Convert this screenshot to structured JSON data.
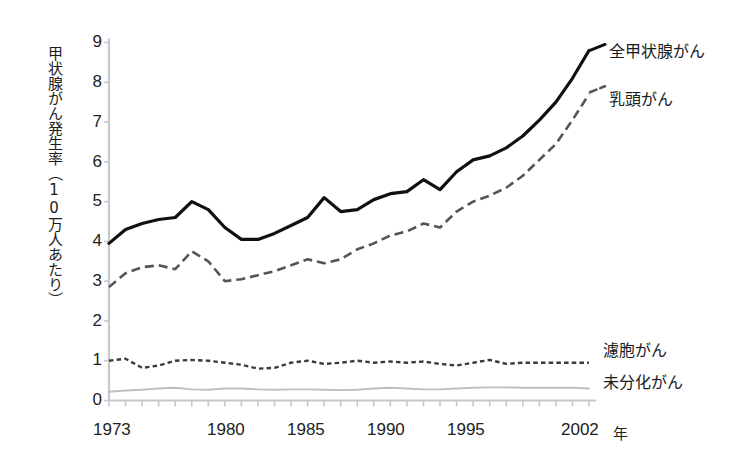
{
  "chart_data": {
    "type": "line",
    "title": "",
    "subtitle": "",
    "xlabel": "年",
    "ylabel": "甲状腺がん発生率（10万人あたり）",
    "xlim": [
      1973,
      2002
    ],
    "ylim": [
      0,
      9
    ],
    "grid": false,
    "legend_position": "right-inline-labels",
    "x": [
      1973,
      1974,
      1975,
      1976,
      1977,
      1978,
      1979,
      1980,
      1981,
      1982,
      1983,
      1984,
      1985,
      1986,
      1987,
      1988,
      1989,
      1990,
      1991,
      1992,
      1993,
      1994,
      1995,
      1996,
      1997,
      1998,
      1999,
      2000,
      2001,
      2002
    ],
    "y_ticks": [
      0,
      1,
      2,
      3,
      4,
      5,
      6,
      7,
      8,
      9
    ],
    "x_ticks_labeled": [
      1973,
      1980,
      1985,
      1990,
      1995,
      2002
    ],
    "series": [
      {
        "name": "全甲状腺がん",
        "style": "solid-black",
        "color": "#101010",
        "label_x": 2002,
        "label_y": 8.8,
        "values": [
          3.95,
          4.3,
          4.45,
          4.55,
          4.6,
          5.0,
          4.8,
          4.35,
          4.05,
          4.05,
          4.2,
          4.4,
          4.6,
          5.1,
          4.75,
          4.8,
          5.05,
          5.2,
          5.25,
          5.55,
          5.3,
          5.75,
          6.05,
          6.15,
          6.35,
          6.65,
          7.05,
          7.5,
          8.1,
          8.8
        ]
      },
      {
        "name": "乳頭がん",
        "style": "dashed-gray",
        "color": "#555555",
        "label_x": 2002,
        "label_y": 7.75,
        "values": [
          2.85,
          3.2,
          3.35,
          3.4,
          3.3,
          3.75,
          3.5,
          3.0,
          3.05,
          3.15,
          3.25,
          3.4,
          3.55,
          3.45,
          3.55,
          3.8,
          3.95,
          4.15,
          4.25,
          4.45,
          4.35,
          4.75,
          5.0,
          5.15,
          5.35,
          5.65,
          6.05,
          6.45,
          7.05,
          7.7
        ]
      },
      {
        "name": "濾胞がん",
        "style": "dotted-dark",
        "color": "#3a3a3a",
        "label_x": 2002,
        "label_y": 1.05,
        "values": [
          1.0,
          1.05,
          0.82,
          0.88,
          1.0,
          1.02,
          1.0,
          0.95,
          0.9,
          0.8,
          0.82,
          0.95,
          1.0,
          0.92,
          0.95,
          1.0,
          0.95,
          0.98,
          0.95,
          0.98,
          0.92,
          0.88,
          0.95,
          1.02,
          0.92,
          0.95,
          0.95,
          0.95,
          0.95,
          0.95
        ]
      },
      {
        "name": "未分化がん",
        "style": "solid-light-gray",
        "color": "#bfbfbf",
        "label_x": 2002,
        "label_y": 0.42,
        "values": [
          0.22,
          0.25,
          0.27,
          0.3,
          0.32,
          0.28,
          0.27,
          0.3,
          0.3,
          0.28,
          0.27,
          0.28,
          0.28,
          0.27,
          0.26,
          0.27,
          0.3,
          0.32,
          0.3,
          0.28,
          0.28,
          0.3,
          0.32,
          0.33,
          0.33,
          0.32,
          0.32,
          0.32,
          0.32,
          0.3
        ]
      }
    ]
  },
  "axes": {
    "y_labels": [
      "9",
      "8",
      "7",
      "6",
      "5",
      "4",
      "3",
      "2",
      "1",
      "0"
    ],
    "y_title": "甲状腺がん発生率（10万人あたり）",
    "x_labels": [
      "1973",
      "1980",
      "1985",
      "1990",
      "1995",
      "2002"
    ],
    "x_unit": "年"
  },
  "labels": {
    "all_thyroid": "全甲状腺がん",
    "papillary": "乳頭がん",
    "follicular": "濾胞がん",
    "anaplastic": "未分化がん"
  },
  "colors": {
    "all_thyroid": "#101010",
    "papillary": "#555555",
    "follicular": "#3a3a3a",
    "anaplastic": "#bfbfbf",
    "axis": "#c9c9c9",
    "text": "#1c1c1c",
    "background": "#ffffff"
  }
}
